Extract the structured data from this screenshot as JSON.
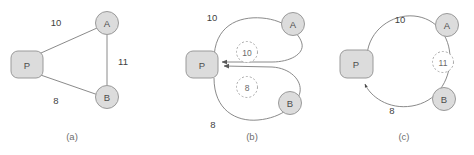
{
  "figure": {
    "colors": {
      "node_fill": "#dcdcdc",
      "node_stroke": "#9a9a9a",
      "edge_stroke": "#7d7d7d",
      "ghost_stroke": "#a8a8a8",
      "label_text": "#3f3f3f",
      "caption_text": "#6e6e6e",
      "background": "#ffffff"
    },
    "panels": [
      {
        "id": "panel-a",
        "caption": "(a)",
        "nodes": [
          {
            "id": "P",
            "label": "P",
            "shape": "rounded-rect"
          },
          {
            "id": "A",
            "label": "A",
            "shape": "circle"
          },
          {
            "id": "B",
            "label": "B",
            "shape": "circle"
          }
        ],
        "edges": [
          {
            "from": "P",
            "to": "A",
            "label": "10",
            "style": "straight",
            "directed": false
          },
          {
            "from": "A",
            "to": "B",
            "label": "11",
            "style": "straight",
            "directed": false
          },
          {
            "from": "P",
            "to": "B",
            "label": "8",
            "style": "straight",
            "directed": false
          }
        ],
        "ghost_nodes": []
      },
      {
        "id": "panel-b",
        "caption": "(b)",
        "nodes": [
          {
            "id": "P",
            "label": "P",
            "shape": "rounded-rect"
          },
          {
            "id": "A",
            "label": "A",
            "shape": "circle"
          },
          {
            "id": "B",
            "label": "B",
            "shape": "circle"
          }
        ],
        "edges": [
          {
            "from": "A",
            "to": "P",
            "label": "10",
            "style": "curved-arc",
            "directed": true
          },
          {
            "from": "B",
            "to": "P",
            "label": "8",
            "style": "curved-arc",
            "directed": true
          }
        ],
        "ghost_nodes": [
          {
            "label": "10",
            "style": "dashed-circle"
          },
          {
            "label": "8",
            "style": "dashed-circle"
          }
        ]
      },
      {
        "id": "panel-c",
        "caption": "(c)",
        "nodes": [
          {
            "id": "P",
            "label": "P",
            "shape": "rounded-rect"
          },
          {
            "id": "A",
            "label": "A",
            "shape": "circle"
          },
          {
            "id": "B",
            "label": "B",
            "shape": "circle"
          }
        ],
        "edges": [
          {
            "from": "P",
            "to": "P",
            "label": "10",
            "style": "large-loop-top",
            "directed": false
          },
          {
            "from": "P",
            "to": "P",
            "label": "8",
            "style": "large-loop-bottom",
            "directed": true
          }
        ],
        "ghost_nodes": [
          {
            "label": "11",
            "style": "dashed-circle"
          }
        ]
      }
    ]
  }
}
